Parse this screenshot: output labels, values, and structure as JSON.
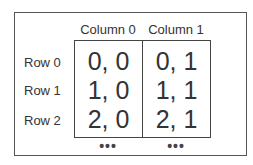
{
  "columns": [
    {
      "label": "Column 0"
    },
    {
      "label": "Column 1"
    }
  ],
  "rows": [
    {
      "label": "Row 0",
      "cells": [
        "0, 0",
        "0, 1"
      ]
    },
    {
      "label": "Row 1",
      "cells": [
        "1, 0",
        "1, 1"
      ]
    },
    {
      "label": "Row 2",
      "cells": [
        "2, 0",
        "2, 1"
      ]
    }
  ],
  "continuation": [
    "•••",
    "•••"
  ]
}
